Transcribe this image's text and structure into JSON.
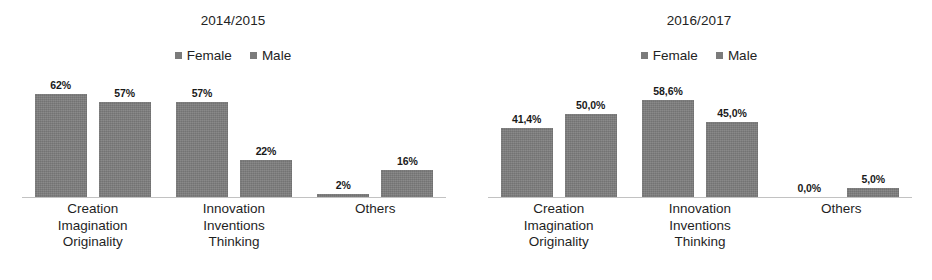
{
  "figure": {
    "background": "#ffffff",
    "bar_color": "#7e7e7e",
    "axis_color": "#c2c2c2"
  },
  "chart_data": [
    {
      "type": "bar",
      "title": "2014/2015",
      "xlabel": "",
      "ylabel": "",
      "ylim": [
        0,
        70
      ],
      "grid": false,
      "legend_position": "top-center",
      "categories": [
        [
          "Creation",
          "Imagination",
          "Originality"
        ],
        [
          "Innovation",
          "Inventions",
          "Thinking"
        ],
        [
          "Others"
        ]
      ],
      "series": [
        {
          "name": "Female",
          "values": [
            62,
            57,
            2
          ],
          "labels": [
            "62%",
            "57%",
            "2%"
          ]
        },
        {
          "name": "Male",
          "values": [
            57,
            22,
            16
          ],
          "labels": [
            "57%",
            "22%",
            "16%"
          ]
        }
      ]
    },
    {
      "type": "bar",
      "title": "2016/2017",
      "xlabel": "",
      "ylabel": "",
      "ylim": [
        0,
        70
      ],
      "grid": false,
      "legend_position": "top-center",
      "categories": [
        [
          "Creation",
          "Imagination",
          "Originality"
        ],
        [
          "Innovation",
          "Inventions",
          "Thinking"
        ],
        [
          "Others"
        ]
      ],
      "series": [
        {
          "name": "Female",
          "values": [
            41.4,
            58.6,
            0.0
          ],
          "labels": [
            "41,4%",
            "58,6%",
            "0,0%"
          ]
        },
        {
          "name": "Male",
          "values": [
            50.0,
            45.0,
            5.0
          ],
          "labels": [
            "50,0%",
            "45,0%",
            "5,0%"
          ]
        }
      ]
    }
  ]
}
